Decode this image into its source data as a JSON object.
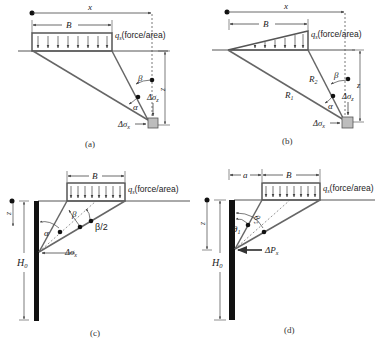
{
  "figure": {
    "panels": [
      {
        "id": "a",
        "caption": "(a)",
        "labels": {
          "x": "x",
          "B": "B",
          "load_q": "q",
          "load_sub": "s",
          "load_unit": "(force/area)",
          "beta": "β",
          "alpha": "α",
          "z": "z",
          "dsz": "Δσ",
          "dsz_sub": "z",
          "dsx": "Δσ",
          "dsx_sub": "x"
        },
        "load_shape": "uniform strip"
      },
      {
        "id": "b",
        "caption": "(b)",
        "labels": {
          "x": "x",
          "B": "B",
          "load_q": "q",
          "load_sub": "s",
          "load_unit": "(force/area)",
          "beta": "β",
          "alpha": "α",
          "z": "z",
          "R1": "R",
          "R1_sub": "1",
          "R2": "R",
          "R2_sub": "2",
          "dsz": "Δσ",
          "dsz_sub": "z",
          "dsx": "Δσ",
          "dsx_sub": "x"
        },
        "load_shape": "triangular strip"
      },
      {
        "id": "c",
        "caption": "(c)",
        "labels": {
          "B": "B",
          "load_q": "q",
          "load_sub": "s",
          "load_unit": "(force/area)",
          "beta": "β",
          "beta_half": "β/2",
          "alpha": "α",
          "z": "z",
          "H": "H",
          "H_sub": "0",
          "dsx": "Δσ",
          "dsx_sub": "x"
        },
        "load_shape": "uniform strip behind wall"
      },
      {
        "id": "d",
        "caption": "(d)",
        "labels": {
          "a": "a",
          "B": "B",
          "load_q": "q",
          "load_sub": "s",
          "load_unit": "(force/area)",
          "theta1": "θ",
          "theta1_sub": "1",
          "theta2": "θ",
          "theta2_sub": "2",
          "z": "z",
          "H": "H",
          "H_sub": "0",
          "dP": "ΔP",
          "dP_sub": "x"
        },
        "load_shape": "uniform strip offset from wall"
      }
    ],
    "colors": {
      "line": "#555555",
      "wall": "#111111",
      "box": "#bdbdbd",
      "text": "#222222"
    }
  }
}
